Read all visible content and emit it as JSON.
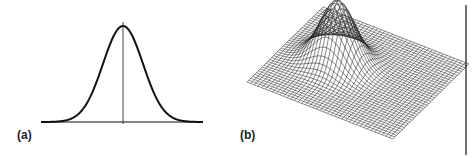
{
  "panels": [
    {
      "id": "a",
      "label": "(a)",
      "description": "1D Gaussian curve with vertical center axis",
      "function": "gaussian-1d"
    },
    {
      "id": "b",
      "label": "(b)",
      "description": "2D Gaussian surface rendered as a wireframe mesh",
      "function": "gaussian-2d",
      "grid_divisions": 40
    }
  ],
  "colors": {
    "line": "#111111",
    "mesh": "#222222",
    "background": "#ffffff"
  }
}
